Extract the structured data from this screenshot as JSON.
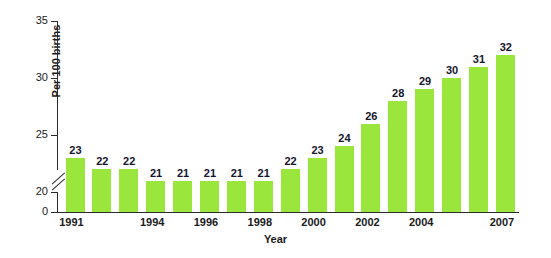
{
  "chart_data": {
    "type": "bar",
    "title": "",
    "subtitle": "",
    "xlabel": "Year",
    "ylabel": "Per 100 births",
    "categories": [
      "1991",
      "1992",
      "1993",
      "1994",
      "1995",
      "1996",
      "1997",
      "1998",
      "1999",
      "2000",
      "2001",
      "2002",
      "2003",
      "2004",
      "2005",
      "2006",
      "2007"
    ],
    "values": [
      23,
      22,
      22,
      21,
      21,
      21,
      21,
      21,
      22,
      23,
      24,
      26,
      28,
      29,
      30,
      31,
      32
    ],
    "series": [
      {
        "name": "Per 100 births",
        "values": [
          23,
          22,
          22,
          21,
          21,
          21,
          21,
          21,
          22,
          23,
          24,
          26,
          28,
          29,
          30,
          31,
          32
        ]
      }
    ],
    "data_labels": [
      "23",
      "22",
      "22",
      "21",
      "21",
      "21",
      "21",
      "21",
      "22",
      "23",
      "24",
      "26",
      "28",
      "29",
      "30",
      "31",
      "32"
    ],
    "ylim": [
      0,
      35
    ],
    "yticks": [
      0,
      20,
      25,
      30,
      35
    ],
    "ytick_labels": [
      "0",
      "20",
      "25",
      "30",
      "35"
    ],
    "y_axis_break": true,
    "y_axis_break_between": [
      0,
      20
    ],
    "xtick_labels": [
      "1991",
      "1994",
      "1996",
      "1998",
      "2000",
      "2002",
      "2004",
      "2007"
    ],
    "xtick_categories": [
      "1991",
      "1994",
      "1996",
      "1998",
      "2000",
      "2002",
      "2004",
      "2007"
    ],
    "grid": false,
    "legend": null,
    "legend_position": "none",
    "bar_color": "#9ae63c",
    "axis_color": "#2b2b2b",
    "text_color": "#1a1a1a",
    "label_color": "#15152b",
    "background_color": "#ffffff"
  }
}
